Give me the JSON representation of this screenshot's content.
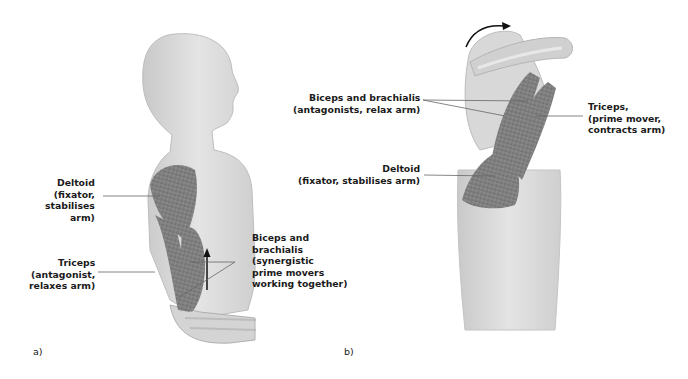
{
  "panels": [
    {
      "id": "a",
      "letter": "a)",
      "labels": [
        {
          "lines": [
            "Deltoid",
            "(fixator,",
            "stabilises",
            "arm)"
          ]
        },
        {
          "lines": [
            "Triceps",
            "(antagonist,",
            "relaxes arm)"
          ]
        },
        {
          "lines": [
            "Biceps and",
            "brachialis",
            "(synergistic",
            "prime movers",
            "working together)"
          ]
        }
      ]
    },
    {
      "id": "b",
      "letter": "b)",
      "labels": [
        {
          "lines": [
            "Biceps and brachialis",
            "(antagonists, relax arm)"
          ]
        },
        {
          "lines": [
            "Triceps,",
            "(prime mover,",
            "contracts arm)"
          ]
        },
        {
          "lines": [
            "Deltoid",
            "(fixator, stabilises arm)"
          ]
        }
      ]
    }
  ],
  "colors": {
    "body": "#d9d9d9",
    "body_shadow": "#b5b5b5",
    "muscle": "#8a8a8a",
    "muscle_dark": "#5e5e5e",
    "leader_line": "#666666",
    "arrow": "#111111"
  }
}
